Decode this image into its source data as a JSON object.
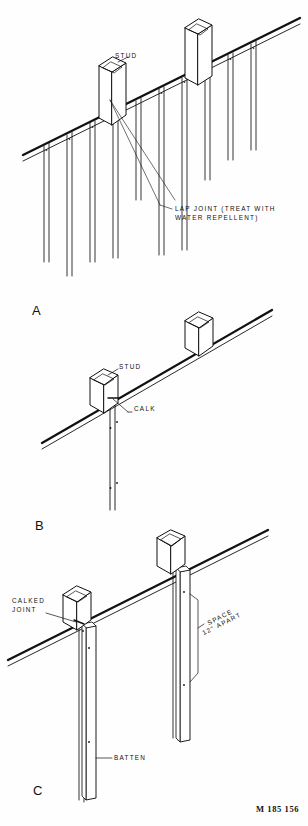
{
  "document": {
    "type": "technical-line-drawing",
    "subject": "Vertical board and batten siding installation details",
    "figure_number": "M 185 156",
    "background_color": "#fefefe",
    "line_color": "#111111"
  },
  "panels": [
    {
      "id": "A",
      "letter": "A",
      "description": "Vertical boards with lap joints over studs",
      "labels": [
        {
          "name": "stud",
          "text": "STUD"
        },
        {
          "name": "lap-joint",
          "line1": "LAP JOINT (TREAT WITH",
          "line2": "WATER REPELLENT)"
        }
      ]
    },
    {
      "id": "B",
      "letter": "B",
      "description": "Single vertical board calked at stud",
      "labels": [
        {
          "name": "stud",
          "text": "STUD"
        },
        {
          "name": "calk",
          "text": "CALK"
        }
      ]
    },
    {
      "id": "C",
      "letter": "C",
      "description": "Board and batten with calked joint and nail spacing",
      "labels": [
        {
          "name": "calked-joint",
          "line1": "CALKED",
          "line2": "JOINT"
        },
        {
          "name": "space-apart",
          "line1": "SPACE",
          "line2": "12\" APART"
        },
        {
          "name": "batten",
          "text": "BATTEN"
        }
      ]
    }
  ]
}
